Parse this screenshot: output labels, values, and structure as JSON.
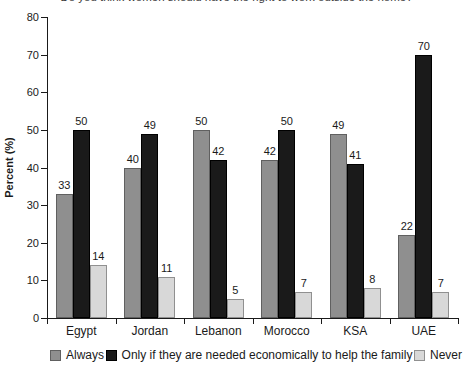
{
  "title": "Do you think women should have the right to work outside the home?",
  "chart_data": {
    "type": "bar",
    "title": "Do you think women should have the right to work outside the home?",
    "categories": [
      "Egypt",
      "Jordan",
      "Lebanon",
      "Morocco",
      "KSA",
      "UAE"
    ],
    "series": [
      {
        "name": "Always",
        "color": "#8f8f8f",
        "border_color": "#606060",
        "values": [
          33,
          40,
          50,
          42,
          49,
          22
        ]
      },
      {
        "name": "Only if they are needed economically to help the family",
        "color": "#1a1a1a",
        "border_color": "#000000",
        "values": [
          50,
          49,
          42,
          50,
          41,
          70
        ]
      },
      {
        "name": "Never",
        "color": "#d8d8d8",
        "border_color": "#909090",
        "values": [
          14,
          11,
          5,
          7,
          8,
          7
        ]
      }
    ],
    "xlabel": "",
    "ylabel": "Percent (%)",
    "ylim": [
      0,
      80
    ],
    "ytick_step": 10,
    "yticks": [
      0,
      10,
      20,
      30,
      40,
      50,
      60,
      70,
      80
    ],
    "grid": false,
    "bar_value_labels": true,
    "legend_position": "bottom",
    "axis_color": "#1a1a1a",
    "background_color": "#ffffff"
  }
}
